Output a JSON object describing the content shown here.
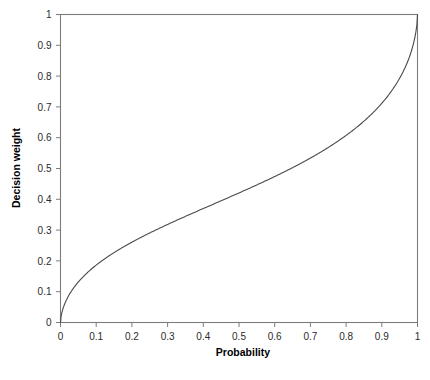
{
  "chart_data": {
    "type": "line",
    "title": "",
    "xlabel": "Probability",
    "ylabel": "Decision weight",
    "xlim": [
      0,
      1
    ],
    "ylim": [
      0,
      1
    ],
    "grid": false,
    "legend": null,
    "x_ticks": [
      "0",
      "0.1",
      "0.2",
      "0.3",
      "0.4",
      "0.5",
      "0.6",
      "0.7",
      "0.8",
      "0.9",
      "1"
    ],
    "y_ticks": [
      "0",
      "0.1",
      "0.2",
      "0.3",
      "0.4",
      "0.5",
      "0.6",
      "0.7",
      "0.8",
      "0.9",
      "1"
    ],
    "x_tick_values": [
      0,
      0.1,
      0.2,
      0.3,
      0.4,
      0.5,
      0.6,
      0.7,
      0.8,
      0.9,
      1
    ],
    "y_tick_values": [
      0,
      0.1,
      0.2,
      0.3,
      0.4,
      0.5,
      0.6,
      0.7,
      0.8,
      0.9,
      1
    ],
    "series": [
      {
        "name": "Decision weight",
        "color": "#4a4a4a",
        "gamma": 0.61,
        "x": [
          0,
          0.005,
          0.01,
          0.02,
          0.03,
          0.04,
          0.05,
          0.06,
          0.07,
          0.08,
          0.09,
          0.1,
          0.12,
          0.14,
          0.16,
          0.18,
          0.2,
          0.25,
          0.3,
          0.35,
          0.4,
          0.45,
          0.5,
          0.55,
          0.6,
          0.65,
          0.7,
          0.75,
          0.8,
          0.85,
          0.9,
          0.93,
          0.95,
          0.96,
          0.97,
          0.98,
          0.99,
          0.995,
          1
        ],
        "values": [
          0,
          0.035,
          0.054,
          0.081,
          0.102,
          0.12,
          0.136,
          0.15,
          0.163,
          0.175,
          0.186,
          0.196,
          0.215,
          0.232,
          0.248,
          0.262,
          0.275,
          0.305,
          0.332,
          0.356,
          0.379,
          0.401,
          0.423,
          0.445,
          0.467,
          0.49,
          0.515,
          0.543,
          0.575,
          0.614,
          0.664,
          0.702,
          0.733,
          0.752,
          0.775,
          0.804,
          0.846,
          0.879,
          1
        ]
      }
    ]
  },
  "axis_labels": {
    "x_title": "Probability",
    "y_title": "Decision weight"
  },
  "colors": {
    "curve": "#4a4a4a",
    "frame": "#7d7d7d",
    "tick_text": "#2b2b2b",
    "background": "#ffffff"
  }
}
